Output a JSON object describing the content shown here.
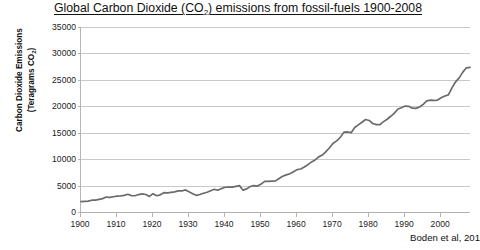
{
  "chart_data": {
    "type": "line",
    "title": "Global Carbon Dioxide (CO2) emissions from fossil-fuels 1900-2008",
    "title_parts": {
      "before": "Global Carbon Dioxide (CO",
      "sub": "2",
      "after": ") emissions from fossil-fuels 1900-2008"
    },
    "xlabel": "",
    "ylabel_parts": {
      "line1": "Carbon Dioxide Emissions",
      "line2_before": "(Teragrams CO",
      "line2_sub": "2",
      "line2_after": ")"
    },
    "ylabel": "Carbon Dioxide Emissions (Teragrams CO2)",
    "xlim": [
      1900,
      2008
    ],
    "ylim": [
      0,
      35000
    ],
    "ytick_labels": [
      "0",
      "5000",
      "10000",
      "15000",
      "20000",
      "25000",
      "30000",
      "35000"
    ],
    "ytick_values": [
      0,
      5000,
      10000,
      15000,
      20000,
      25000,
      30000,
      35000
    ],
    "xtick_labels": [
      "1900",
      "1910",
      "1920",
      "1930",
      "1940",
      "1950",
      "1960",
      "1970",
      "1980",
      "1990",
      "2000"
    ],
    "xtick_values": [
      1900,
      1910,
      1920,
      1930,
      1940,
      1950,
      1960,
      1970,
      1980,
      1990,
      2000
    ],
    "grid": true,
    "legend": false,
    "line_color": "#6b6b6b",
    "annotation_source": "Boden et al, 201",
    "x": [
      1900,
      1901,
      1902,
      1903,
      1904,
      1905,
      1906,
      1907,
      1908,
      1909,
      1910,
      1911,
      1912,
      1913,
      1914,
      1915,
      1916,
      1917,
      1918,
      1919,
      1920,
      1921,
      1922,
      1923,
      1924,
      1925,
      1926,
      1927,
      1928,
      1929,
      1930,
      1931,
      1932,
      1933,
      1934,
      1935,
      1936,
      1937,
      1938,
      1939,
      1940,
      1941,
      1942,
      1943,
      1944,
      1945,
      1946,
      1947,
      1948,
      1949,
      1950,
      1951,
      1952,
      1953,
      1954,
      1955,
      1956,
      1957,
      1958,
      1959,
      1960,
      1961,
      1962,
      1963,
      1964,
      1965,
      1966,
      1967,
      1968,
      1969,
      1970,
      1971,
      1972,
      1973,
      1974,
      1975,
      1976,
      1977,
      1978,
      1979,
      1980,
      1981,
      1982,
      1983,
      1984,
      1985,
      1986,
      1987,
      1988,
      1989,
      1990,
      1991,
      1992,
      1993,
      1994,
      1995,
      1996,
      1997,
      1998,
      1999,
      2000,
      2001,
      2002,
      2003,
      2004,
      2005,
      2006,
      2007,
      2008
    ],
    "values": [
      1955,
      2017,
      2070,
      2230,
      2250,
      2390,
      2530,
      2820,
      2760,
      2890,
      3000,
      3050,
      3150,
      3350,
      3100,
      3070,
      3300,
      3420,
      3310,
      2950,
      3470,
      3080,
      3250,
      3650,
      3620,
      3720,
      3800,
      4000,
      3980,
      4180,
      3810,
      3470,
      3160,
      3310,
      3540,
      3740,
      4020,
      4290,
      4120,
      4430,
      4680,
      4690,
      4700,
      4860,
      4990,
      4130,
      4370,
      4820,
      5000,
      4900,
      5280,
      5800,
      5790,
      5850,
      5880,
      6340,
      6750,
      7020,
      7230,
      7600,
      8020,
      8140,
      8500,
      8950,
      9480,
      9850,
      10430,
      10770,
      11420,
      12150,
      13000,
      13460,
      14140,
      15110,
      15140,
      15010,
      15980,
      16490,
      16970,
      17490,
      17320,
      16740,
      16530,
      16530,
      17090,
      17550,
      18110,
      18700,
      19480,
      19730,
      20040,
      20000,
      19650,
      19600,
      19860,
      20370,
      21030,
      21150,
      21100,
      21180,
      21610,
      21950,
      22170,
      23490,
      24630,
      25380,
      26460,
      27280,
      27350
    ]
  }
}
